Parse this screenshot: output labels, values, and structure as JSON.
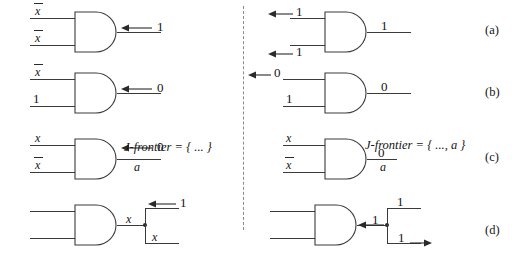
{
  "figure": {
    "background": "#ffffff",
    "line_color": "#3a3a3a",
    "divider_style": "dashed-vertical"
  },
  "case_labels": [
    {
      "id": "a",
      "text": "(a)"
    },
    {
      "id": "b",
      "text": "(b)"
    },
    {
      "id": "c",
      "text": "(c)"
    },
    {
      "id": "d",
      "text": "(d)"
    }
  ],
  "left_column": {
    "row_a": {
      "gate_type": "AND",
      "input_top": "x",
      "input_top_overbar": true,
      "input_bottom": "x",
      "input_bottom_overbar": true,
      "output_value": "1",
      "output_arrow_direction": "left"
    },
    "row_b": {
      "gate_type": "AND",
      "input_top": "x",
      "input_top_overbar": true,
      "input_bottom": "1",
      "input_bottom_overbar": false,
      "output_value": "0",
      "output_arrow_direction": "left"
    },
    "row_c": {
      "gate_type": "AND",
      "input_top": "x",
      "input_top_overbar": false,
      "input_bottom": "x",
      "input_bottom_overbar": true,
      "output_value": "0",
      "output_arrow_direction": "left",
      "output_net_name": "a",
      "j_frontier": "J-frontier = {  ...  }"
    },
    "row_d": {
      "gate_type": "AND",
      "input_top": "",
      "input_bottom": "",
      "output_value": "x",
      "fanout": true,
      "branch_up_value": "1",
      "branch_up_arrow_direction": "left",
      "branch_down_value": "x",
      "branch_down_arrow_direction": "none"
    }
  },
  "right_column": {
    "row_a": {
      "gate_type": "AND",
      "input_top": "1",
      "input_top_arrow_direction": "left",
      "input_bottom": "1",
      "input_bottom_arrow_direction": "left",
      "output_value": "1",
      "output_arrow_direction": "none"
    },
    "row_b": {
      "gate_type": "AND",
      "input_top": "0",
      "input_top_arrow_direction": "left",
      "input_bottom": "1",
      "input_bottom_arrow_direction": "none",
      "output_value": "0",
      "output_arrow_direction": "none"
    },
    "row_c": {
      "gate_type": "AND",
      "input_top": "x",
      "input_top_overbar": false,
      "input_bottom": "x",
      "input_bottom_overbar": true,
      "output_value": "0",
      "output_net_name": "a",
      "j_frontier": "J-frontier = {  ..., a  }"
    },
    "row_d": {
      "gate_type": "AND",
      "input_top": "",
      "input_bottom": "",
      "output_value": "1",
      "output_arrow_direction": "left",
      "fanout": true,
      "branch_up_value": "1",
      "branch_up_arrow_direction": "none",
      "branch_down_value": "1",
      "branch_down_arrow_direction": "right"
    }
  }
}
